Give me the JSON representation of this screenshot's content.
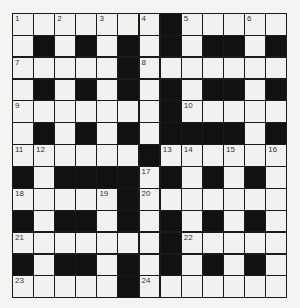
{
  "puzzle": {
    "rows": 13,
    "cols": 13,
    "colors": {
      "block": "#111111",
      "cell": "#f1f1ef",
      "background": "#f4f4f2"
    },
    "grid": [
      "WWWWWWWBWWWWW",
      "WBWBWBWBWBBWB",
      "WWWWWBWWWWWWW",
      "WBWBWBWBWBBWB",
      "WWWWWWWBWWWWW",
      "WBWBWBWBBBBWB",
      "WWWWWWBWWWWWW",
      "BWBBBBWBWBWBW",
      "WWWWWBWWWWWWW",
      "BWBBWBWBWBWBW",
      "WWWWWWWBWWWWW",
      "BWBBWBWBWBWBW",
      "WWWWWBWWWWWWW"
    ],
    "numbers": [
      {
        "n": "1",
        "r": 0,
        "c": 0
      },
      {
        "n": "2",
        "r": 0,
        "c": 2
      },
      {
        "n": "3",
        "r": 0,
        "c": 4
      },
      {
        "n": "4",
        "r": 0,
        "c": 6
      },
      {
        "n": "5",
        "r": 0,
        "c": 8
      },
      {
        "n": "6",
        "r": 0,
        "c": 11
      },
      {
        "n": "7",
        "r": 2,
        "c": 0
      },
      {
        "n": "8",
        "r": 2,
        "c": 6
      },
      {
        "n": "9",
        "r": 4,
        "c": 0
      },
      {
        "n": "10",
        "r": 4,
        "c": 8
      },
      {
        "n": "11",
        "r": 6,
        "c": 0
      },
      {
        "n": "12",
        "r": 6,
        "c": 1
      },
      {
        "n": "13",
        "r": 6,
        "c": 7
      },
      {
        "n": "14",
        "r": 6,
        "c": 8
      },
      {
        "n": "15",
        "r": 6,
        "c": 10
      },
      {
        "n": "16",
        "r": 6,
        "c": 12
      },
      {
        "n": "17",
        "r": 7,
        "c": 6
      },
      {
        "n": "18",
        "r": 8,
        "c": 0
      },
      {
        "n": "19",
        "r": 8,
        "c": 4
      },
      {
        "n": "20",
        "r": 8,
        "c": 6
      },
      {
        "n": "21",
        "r": 10,
        "c": 0
      },
      {
        "n": "22",
        "r": 10,
        "c": 8
      },
      {
        "n": "23",
        "r": 12,
        "c": 0
      },
      {
        "n": "24",
        "r": 12,
        "c": 6
      }
    ]
  }
}
